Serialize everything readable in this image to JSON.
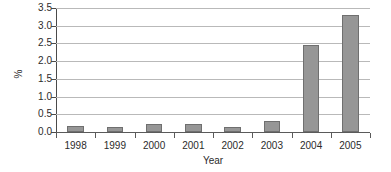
{
  "chart_data": {
    "type": "bar",
    "title": "",
    "xlabel": "Year",
    "ylabel": "%",
    "categories": [
      "1998",
      "1999",
      "2000",
      "2001",
      "2002",
      "2003",
      "2004",
      "2005"
    ],
    "values": [
      0.18,
      0.13,
      0.23,
      0.22,
      0.13,
      0.31,
      2.45,
      3.3
    ],
    "ylim": [
      0.0,
      3.5
    ],
    "ytick_step": 0.5,
    "ytick_labels": [
      "0.0",
      "0.5",
      "1.0",
      "1.5",
      "2.0",
      "2.5",
      "3.0",
      "3.5"
    ],
    "grid": true,
    "grid_axis": "y",
    "legend": "none",
    "series": [
      {
        "name": "%",
        "values": [
          0.18,
          0.13,
          0.23,
          0.22,
          0.13,
          0.31,
          2.45,
          3.3
        ]
      }
    ],
    "colors": {
      "bar_fill": "#969696",
      "bar_border": "#6f6f6f",
      "gridline": "#b9b9b9",
      "axis": "#5a5a5a",
      "background": "#ffffff",
      "text": "#2b2b2b"
    }
  }
}
